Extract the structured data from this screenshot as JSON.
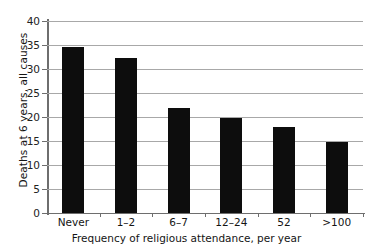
{
  "chart_data": {
    "type": "bar",
    "title": "",
    "categories": [
      "Never",
      "1–2",
      "6–7",
      "12–24",
      "52",
      ">100"
    ],
    "values": [
      34.6,
      32.2,
      21.8,
      19.8,
      17.9,
      14.8
    ],
    "xlabel": "Frequency of religious attendance, per year",
    "ylabel": "Deaths at 6 years, all causes",
    "ylim": [
      0,
      40
    ],
    "yticks": [
      0,
      5,
      10,
      15,
      20,
      25,
      30,
      35,
      40
    ],
    "ytick_labels": [
      "0",
      "5",
      "10",
      "15",
      "20",
      "25",
      "30",
      "35",
      "40"
    ],
    "grid": "horizontal",
    "legend": "none",
    "bar_color": "#0d0d0d",
    "grid_color": "#a8a8a8",
    "axis_color": "#6e6e6e"
  }
}
